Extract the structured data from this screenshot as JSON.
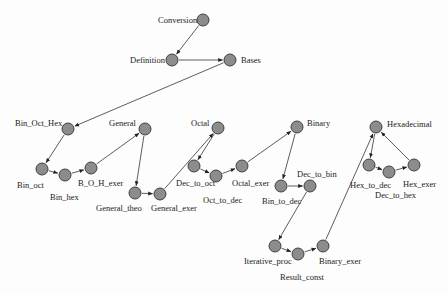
{
  "diagram": {
    "type": "directed-graph",
    "node_color": "#8c8c8c",
    "edge_color": "#333333",
    "nodes": [
      {
        "id": "Conversion",
        "label": "Conversion",
        "x": 203,
        "y": 20,
        "lx": 158,
        "ly": 23,
        "anchor": "start"
      },
      {
        "id": "Definition",
        "label": "Definition",
        "x": 172,
        "y": 60,
        "lx": 130,
        "ly": 63,
        "anchor": "start"
      },
      {
        "id": "Bases",
        "label": "Bases",
        "x": 230,
        "y": 60,
        "lx": 241,
        "ly": 63,
        "anchor": "start"
      },
      {
        "id": "Bin_Oct_Hex",
        "label": "Bin_Oct_Hex",
        "x": 68,
        "y": 129,
        "lx": 15,
        "ly": 126,
        "anchor": "start"
      },
      {
        "id": "Bin_oct",
        "label": "Bin_oct",
        "x": 42,
        "y": 169,
        "lx": 17,
        "ly": 188,
        "anchor": "start"
      },
      {
        "id": "Bin_hex",
        "label": "Bin_hex",
        "x": 65,
        "y": 175,
        "lx": 50,
        "ly": 200,
        "anchor": "start"
      },
      {
        "id": "B_O_H_exer",
        "label": "B_O_H_exer",
        "x": 91,
        "y": 168,
        "lx": 78,
        "ly": 186,
        "anchor": "start"
      },
      {
        "id": "General",
        "label": "General",
        "x": 145,
        "y": 129,
        "lx": 109,
        "ly": 126,
        "anchor": "start"
      },
      {
        "id": "General_theo",
        "label": "General_theo",
        "x": 135,
        "y": 193,
        "lx": 96,
        "ly": 211,
        "anchor": "start"
      },
      {
        "id": "General_exer",
        "label": "General_exer",
        "x": 160,
        "y": 194,
        "lx": 151,
        "ly": 211,
        "anchor": "start"
      },
      {
        "id": "Octal",
        "label": "Octal",
        "x": 218,
        "y": 128,
        "lx": 191,
        "ly": 126,
        "anchor": "start"
      },
      {
        "id": "Dec_to_oct",
        "label": "Dec_to_oct",
        "x": 194,
        "y": 166,
        "lx": 176,
        "ly": 186,
        "anchor": "start"
      },
      {
        "id": "Oct_to_dec",
        "label": "Oct_to_dec",
        "x": 216,
        "y": 176,
        "lx": 203,
        "ly": 203,
        "anchor": "start"
      },
      {
        "id": "Octal_exer",
        "label": "Octal_exer",
        "x": 242,
        "y": 166,
        "lx": 232,
        "ly": 186,
        "anchor": "start"
      },
      {
        "id": "Binary",
        "label": "Binary",
        "x": 297,
        "y": 127,
        "lx": 307,
        "ly": 126,
        "anchor": "start"
      },
      {
        "id": "Bin_to_dec",
        "label": "Bin_to_dec",
        "x": 281,
        "y": 186,
        "lx": 262,
        "ly": 204,
        "anchor": "start"
      },
      {
        "id": "Dec_to_bin",
        "label": "Dec_to_bin",
        "x": 310,
        "y": 186,
        "lx": 297,
        "ly": 177,
        "anchor": "start"
      },
      {
        "id": "Iterative_proc",
        "label": "Iterative_proc",
        "x": 275,
        "y": 246,
        "lx": 244,
        "ly": 264,
        "anchor": "start"
      },
      {
        "id": "Result_const",
        "label": "Result_const",
        "x": 298,
        "y": 254,
        "lx": 280,
        "ly": 280,
        "anchor": "start"
      },
      {
        "id": "Binary_exer",
        "label": "Binary_exer",
        "x": 323,
        "y": 246,
        "lx": 319,
        "ly": 264,
        "anchor": "start"
      },
      {
        "id": "Hexadecimal",
        "label": "Hexadecimal",
        "x": 376,
        "y": 127,
        "lx": 387,
        "ly": 127,
        "anchor": "start"
      },
      {
        "id": "Hex_to_dec",
        "label": "Hex_to_dec",
        "x": 369,
        "y": 165,
        "lx": 350,
        "ly": 188,
        "anchor": "start"
      },
      {
        "id": "Dec_to_hex",
        "label": "Dec_to_hex",
        "x": 389,
        "y": 172,
        "lx": 375,
        "ly": 198,
        "anchor": "start"
      },
      {
        "id": "Hex_exer",
        "label": "Hex_exer",
        "x": 414,
        "y": 165,
        "lx": 403,
        "ly": 187,
        "anchor": "start"
      }
    ],
    "edges": [
      [
        "Conversion",
        "Definition"
      ],
      [
        "Definition",
        "Bases"
      ],
      [
        "Bases",
        "Bin_Oct_Hex"
      ],
      [
        "Bin_Oct_Hex",
        "Bin_oct"
      ],
      [
        "Bin_oct",
        "Bin_hex"
      ],
      [
        "Bin_hex",
        "B_O_H_exer"
      ],
      [
        "B_O_H_exer",
        "General"
      ],
      [
        "General",
        "General_theo"
      ],
      [
        "General_theo",
        "General_exer"
      ],
      [
        "General_exer",
        "Octal"
      ],
      [
        "Octal",
        "Dec_to_oct"
      ],
      [
        "Dec_to_oct",
        "Oct_to_dec"
      ],
      [
        "Oct_to_dec",
        "Octal_exer"
      ],
      [
        "Octal_exer",
        "Binary"
      ],
      [
        "Binary",
        "Bin_to_dec"
      ],
      [
        "Bin_to_dec",
        "Dec_to_bin"
      ],
      [
        "Dec_to_bin",
        "Iterative_proc"
      ],
      [
        "Iterative_proc",
        "Result_const"
      ],
      [
        "Result_const",
        "Binary_exer"
      ],
      [
        "Binary_exer",
        "Hexadecimal"
      ],
      [
        "Hexadecimal",
        "Hex_to_dec"
      ],
      [
        "Hex_to_dec",
        "Dec_to_hex"
      ],
      [
        "Dec_to_hex",
        "Hex_exer"
      ],
      [
        "Hex_exer",
        "Hexadecimal"
      ]
    ]
  }
}
